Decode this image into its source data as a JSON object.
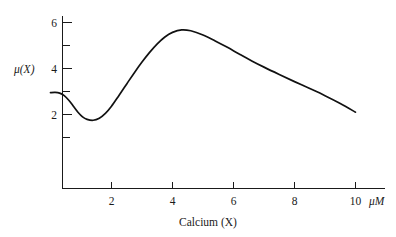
{
  "chart_data": {
    "type": "line",
    "title": "",
    "xlabel": "Calcium (X)",
    "ylabel": "μ(X)",
    "x_unit": "μM",
    "xlim": [
      0,
      10.5
    ],
    "ylim": [
      0,
      6.6
    ],
    "grid": false,
    "legend": null,
    "x_ticks_major": [
      2,
      4,
      6,
      8,
      10
    ],
    "x_tick_labels": [
      "2",
      "4",
      "6",
      "8",
      "10"
    ],
    "y_ticks_major": [
      2,
      4,
      6
    ],
    "y_tick_labels": [
      "2",
      "4",
      "6"
    ],
    "y_ticks_minor": [
      1,
      3,
      5
    ],
    "series": [
      {
        "name": "μ(X)",
        "color": "#111111",
        "x": [
          0.0,
          0.15,
          0.3,
          0.45,
          0.6,
          0.75,
          0.9,
          1.05,
          1.2,
          1.4,
          1.6,
          1.8,
          2.0,
          2.25,
          2.5,
          2.75,
          3.0,
          3.25,
          3.5,
          3.75,
          4.0,
          4.3,
          4.6,
          5.0,
          5.4,
          5.8,
          6.2,
          6.6,
          7.0,
          7.5,
          8.0,
          8.5,
          9.0,
          9.5,
          10.0
        ],
        "y": [
          2.95,
          2.96,
          2.93,
          2.82,
          2.62,
          2.36,
          2.1,
          1.9,
          1.79,
          1.75,
          1.84,
          2.05,
          2.36,
          2.84,
          3.33,
          3.82,
          4.28,
          4.7,
          5.07,
          5.37,
          5.57,
          5.68,
          5.64,
          5.46,
          5.2,
          4.92,
          4.62,
          4.33,
          4.06,
          3.74,
          3.43,
          3.13,
          2.82,
          2.48,
          2.1
        ]
      }
    ],
    "annotations": {
      "start_value": 2.95,
      "local_minimum": {
        "x": 1.4,
        "y": 1.75
      },
      "peak": {
        "x": 4.3,
        "y": 5.68
      },
      "end_value": 2.1
    }
  },
  "axes": {
    "y_axis_label": "μ(X)",
    "x_axis_label": "Calcium (X)",
    "x_axis_unit": "μM",
    "y_labels": [
      "6",
      "4",
      "2"
    ],
    "x_labels": [
      "2",
      "4",
      "6",
      "8",
      "10"
    ]
  }
}
